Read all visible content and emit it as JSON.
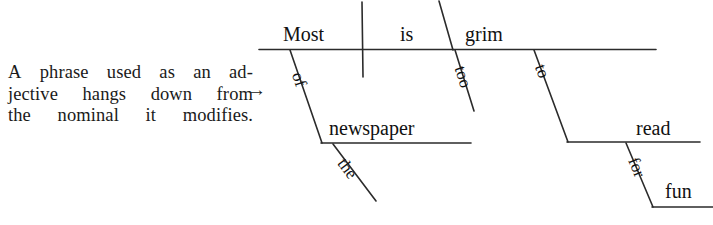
{
  "figure": {
    "kind": "reed-kellogg-sentence-diagram",
    "line_color": "#2b2b2b",
    "text_color": "#111111",
    "background": "#ffffff"
  },
  "caption": {
    "full_text": "A phrase used as an adjective hangs down from the nominal it modifies.",
    "lines": [
      "A phrase used as an ad-",
      "jective hangs down from",
      "the nominal it modifies."
    ],
    "line1_words": [
      "A",
      "phrase",
      "used",
      "as",
      "an",
      "ad-"
    ],
    "line2_words": [
      "jective",
      "hangs",
      "down",
      "from"
    ],
    "line3_words": [
      "the",
      "nominal",
      "it",
      "modifies."
    ],
    "pointer_glyph": "→"
  },
  "diagram": {
    "sentence": "Most of the newspaper is too grim to read for fun.",
    "baseline_words": [
      {
        "label": "Most",
        "role": "subject"
      },
      {
        "label": "is",
        "role": "linking-verb"
      },
      {
        "label": "grim",
        "role": "predicate-adjective"
      }
    ],
    "modifiers": [
      {
        "label": "of",
        "role": "preposition",
        "orientation": "slant"
      },
      {
        "label": "newspaper",
        "role": "object-of-preposition",
        "orientation": "horizontal"
      },
      {
        "label": "the",
        "role": "article",
        "orientation": "slant"
      },
      {
        "label": "too",
        "role": "adverb",
        "orientation": "slant"
      },
      {
        "label": "to",
        "role": "infinitive-marker",
        "orientation": "slant"
      },
      {
        "label": "read",
        "role": "infinitive-verb",
        "orientation": "horizontal"
      },
      {
        "label": "for",
        "role": "preposition",
        "orientation": "slant"
      },
      {
        "label": "fun",
        "role": "object-of-preposition",
        "orientation": "horizontal"
      }
    ]
  },
  "labels": {
    "most": "Most",
    "is": "is",
    "grim": "grim",
    "of": "of",
    "newspaper": "newspaper",
    "the": "the",
    "too": "too",
    "to": "to",
    "read": "read",
    "for": "for",
    "fun": "fun"
  }
}
